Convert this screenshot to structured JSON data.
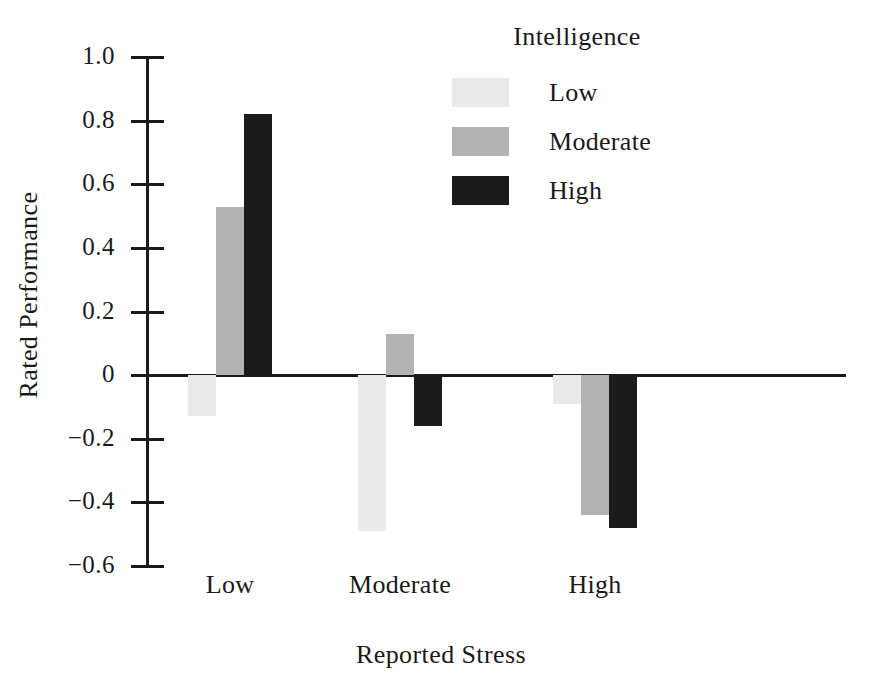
{
  "chart_data": {
    "type": "bar",
    "title": "",
    "xlabel": "Reported Stress",
    "ylabel": "Rated Performance",
    "categories": [
      "Low",
      "Moderate",
      "High"
    ],
    "series": [
      {
        "name": "Low",
        "values": [
          -0.13,
          -0.49,
          -0.09
        ],
        "color": "#e9e9e9"
      },
      {
        "name": "Moderate",
        "values": [
          0.53,
          0.13,
          -0.44
        ],
        "color": "#b2b2b2"
      },
      {
        "name": "High",
        "values": [
          0.82,
          -0.16,
          -0.48
        ],
        "color": "#1b1b1b"
      }
    ],
    "ylim": [
      -0.6,
      1.0
    ],
    "yticks": [
      "1.0",
      "0.8",
      "0.6",
      "0.4",
      "0.2",
      "0",
      "−0.2",
      "−0.4",
      "−0.6"
    ],
    "ytick_values": [
      1.0,
      0.8,
      0.6,
      0.4,
      0.2,
      0,
      -0.2,
      -0.4,
      -0.6
    ],
    "grid": false,
    "legend_position": "top-right",
    "legend_title": "Intelligence"
  },
  "axes": {
    "y_title": "Rated Performance",
    "x_title": "Reported Stress",
    "tick_labels": [
      "1.0",
      "0.8",
      "0.6",
      "0.4",
      "0.2",
      "0",
      "−0.2",
      "−0.4",
      "−0.6"
    ],
    "category_labels": [
      "Low",
      "Moderate",
      "High"
    ]
  },
  "legend": {
    "title": "Intelligence",
    "items": [
      {
        "label": "Low",
        "color": "#e9e9e9"
      },
      {
        "label": "Moderate",
        "color": "#b2b2b2"
      },
      {
        "label": "High",
        "color": "#1b1b1b"
      }
    ]
  }
}
